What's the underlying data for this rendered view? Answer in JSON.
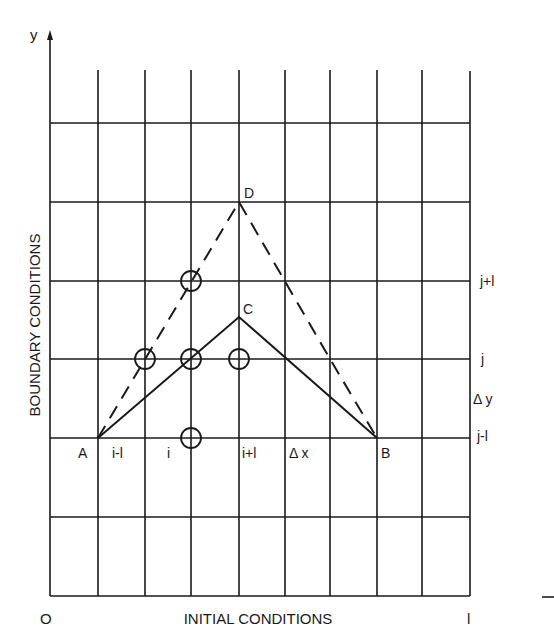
{
  "diagram": {
    "type": "finite-difference-grid",
    "axis": {
      "y_label": "y",
      "origin_label": "O",
      "x_end_label": "l",
      "x_axis_title": "INITIAL CONDITIONS",
      "y_axis_title": "BOUNDARY CONDITIONS"
    },
    "points": {
      "A": "A",
      "B": "B",
      "C": "C",
      "D": "D"
    },
    "column_labels": {
      "i_minus_1": "i-l",
      "i": "i",
      "i_plus_1": "i+l",
      "dx": "Δ x"
    },
    "row_labels": {
      "j_plus_1": "j+l",
      "j": "j",
      "dy": "Δ y",
      "j_minus_1": "j-l"
    },
    "colors": {
      "ink": "#1a1a1a",
      "background": "#ffffff"
    },
    "grid": {
      "vertical_x": [
        50,
        98,
        145,
        191,
        239,
        285,
        330,
        377,
        422,
        470
      ],
      "horizontal_y": [
        123,
        202,
        281,
        359,
        438,
        517,
        596
      ]
    },
    "stencil_nodes": [
      {
        "col": "i",
        "row": "j+1"
      },
      {
        "col": "i-1",
        "row": "j"
      },
      {
        "col": "i",
        "row": "j"
      },
      {
        "col": "i+1",
        "row": "j"
      },
      {
        "col": "i",
        "row": "j-1"
      }
    ]
  }
}
